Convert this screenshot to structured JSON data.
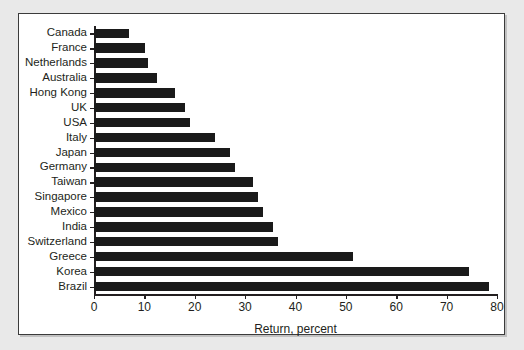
{
  "chart_data": {
    "type": "bar",
    "orientation": "horizontal",
    "title": "",
    "xlabel": "Return, percent",
    "ylabel": "",
    "xlim": [
      0,
      80
    ],
    "xticks": [
      0,
      10,
      20,
      30,
      40,
      50,
      60,
      70,
      80
    ],
    "grid": false,
    "legend": null,
    "bar_color": "#1a1a1a",
    "categories": [
      "Canada",
      "France",
      "Netherlands",
      "Australia",
      "Hong Kong",
      "UK",
      "USA",
      "Italy",
      "Japan",
      "Germany",
      "Taiwan",
      "Singapore",
      "Mexico",
      "India",
      "Switzerland",
      "Greece",
      "Korea",
      "Brazil"
    ],
    "values": [
      7.0,
      10.2,
      10.8,
      12.5,
      16.0,
      18.0,
      19.0,
      24.0,
      27.0,
      28.0,
      31.5,
      32.5,
      33.5,
      35.5,
      36.5,
      51.5,
      74.5,
      78.5
    ]
  },
  "colors": {
    "page_background": "#e9e9e9",
    "panel_background": "#ffffff",
    "panel_border": "#3b3b3b",
    "axis": "#231f20",
    "text": "#231f20",
    "bar": "#1a1a1a"
  }
}
